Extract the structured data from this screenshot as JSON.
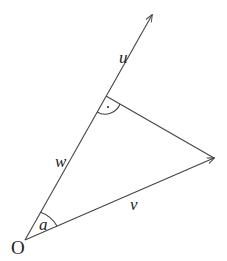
{
  "diagram": {
    "labels": {
      "origin": "O",
      "u": "u",
      "w": "w",
      "v": "v",
      "angle": "a"
    },
    "right_angle_marker": "·"
  }
}
